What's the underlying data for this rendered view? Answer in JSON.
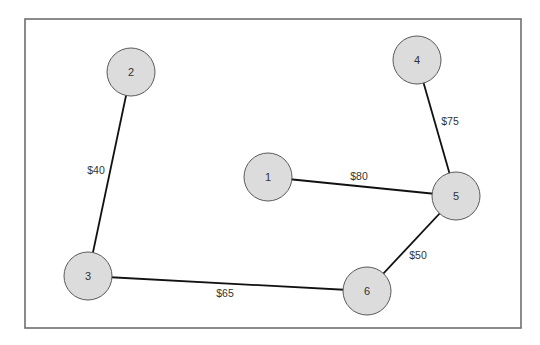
{
  "diagram": {
    "type": "weighted-graph",
    "frame": {
      "x": 25,
      "y": 19,
      "width": 496,
      "height": 309
    },
    "node_radius": 24,
    "nodes": [
      {
        "id": "1",
        "label": "1",
        "x": 268,
        "y": 177
      },
      {
        "id": "2",
        "label": "2",
        "x": 131,
        "y": 72
      },
      {
        "id": "3",
        "label": "3",
        "x": 88,
        "y": 276
      },
      {
        "id": "4",
        "label": "4",
        "x": 417,
        "y": 60
      },
      {
        "id": "5",
        "label": "5",
        "x": 456,
        "y": 196
      },
      {
        "id": "6",
        "label": "6",
        "x": 367,
        "y": 291
      }
    ],
    "edges": [
      {
        "from": "2",
        "to": "3",
        "label": "$40",
        "label_x": 96,
        "label_y": 170
      },
      {
        "from": "1",
        "to": "5",
        "label": "$80",
        "label_x": 359,
        "label_y": 176
      },
      {
        "from": "4",
        "to": "5",
        "label": "$75",
        "label_x": 450,
        "label_y": 121
      },
      {
        "from": "5",
        "to": "6",
        "label": "$50",
        "label_x": 418,
        "label_y": 255
      },
      {
        "from": "3",
        "to": "6",
        "label": "$65",
        "label_x": 225,
        "label_y": 293
      }
    ],
    "colors": {
      "node_fill": "#dcdcdc",
      "node_stroke": "#5a5a5a",
      "edge": "#111111",
      "frame": "#6e6e6e",
      "text": "#333333"
    }
  }
}
